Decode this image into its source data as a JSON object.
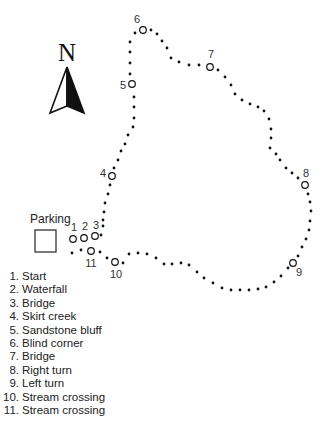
{
  "map": {
    "north_label": "N",
    "parking_label": "Parking",
    "markers": [
      {
        "id": "1",
        "x": 73,
        "y": 239,
        "lx": 74,
        "ly": 231
      },
      {
        "id": "2",
        "x": 84,
        "y": 238,
        "lx": 85,
        "ly": 230
      },
      {
        "id": "3",
        "x": 95,
        "y": 236,
        "lx": 96,
        "ly": 229
      },
      {
        "id": "4",
        "x": 112,
        "y": 176,
        "lx": 103,
        "ly": 177
      },
      {
        "id": "5",
        "x": 132,
        "y": 84,
        "lx": 123,
        "ly": 89
      },
      {
        "id": "6",
        "x": 143,
        "y": 30,
        "lx": 137,
        "ly": 23
      },
      {
        "id": "7",
        "x": 210,
        "y": 67,
        "lx": 211,
        "ly": 58
      },
      {
        "id": "8",
        "x": 305,
        "y": 185,
        "lx": 306,
        "ly": 177
      },
      {
        "id": "9",
        "x": 293,
        "y": 263,
        "lx": 299,
        "ly": 276
      },
      {
        "id": "10",
        "x": 115,
        "y": 262,
        "lx": 116,
        "ly": 278
      },
      {
        "id": "11",
        "x": 91,
        "y": 251,
        "lx": 91,
        "ly": 267
      }
    ],
    "trail_dots": [
      [
        103,
        226
      ],
      [
        101,
        235
      ],
      [
        103,
        220
      ],
      [
        104,
        212
      ],
      [
        105,
        203
      ],
      [
        108,
        194
      ],
      [
        110,
        185
      ],
      [
        114,
        168
      ],
      [
        118,
        160
      ],
      [
        121,
        151
      ],
      [
        125,
        144
      ],
      [
        128,
        135
      ],
      [
        133,
        127
      ],
      [
        134,
        118
      ],
      [
        134,
        107
      ],
      [
        134,
        97
      ],
      [
        130,
        74
      ],
      [
        130,
        63
      ],
      [
        130,
        52
      ],
      [
        130,
        42
      ],
      [
        135,
        33
      ],
      [
        151,
        30
      ],
      [
        157,
        34
      ],
      [
        162,
        41
      ],
      [
        167,
        48
      ],
      [
        171,
        58
      ],
      [
        179,
        62
      ],
      [
        189,
        65
      ],
      [
        199,
        65
      ],
      [
        218,
        70
      ],
      [
        225,
        77
      ],
      [
        231,
        85
      ],
      [
        235,
        94
      ],
      [
        242,
        100
      ],
      [
        250,
        104
      ],
      [
        258,
        107
      ],
      [
        264,
        111
      ],
      [
        269,
        119
      ],
      [
        271,
        129
      ],
      [
        271,
        138
      ],
      [
        270,
        148
      ],
      [
        276,
        154
      ],
      [
        280,
        160
      ],
      [
        286,
        168
      ],
      [
        292,
        173
      ],
      [
        298,
        178
      ],
      [
        308,
        194
      ],
      [
        310,
        202
      ],
      [
        311,
        211
      ],
      [
        310,
        221
      ],
      [
        309,
        230
      ],
      [
        306,
        239
      ],
      [
        302,
        247
      ],
      [
        298,
        256
      ],
      [
        288,
        268
      ],
      [
        281,
        276
      ],
      [
        274,
        282
      ],
      [
        266,
        287
      ],
      [
        258,
        289
      ],
      [
        249,
        290
      ],
      [
        240,
        290
      ],
      [
        231,
        290
      ],
      [
        222,
        288
      ],
      [
        213,
        283
      ],
      [
        204,
        278
      ],
      [
        197,
        272
      ],
      [
        189,
        265
      ],
      [
        181,
        263
      ],
      [
        172,
        264
      ],
      [
        164,
        264
      ],
      [
        156,
        258
      ],
      [
        147,
        254
      ],
      [
        138,
        253
      ],
      [
        129,
        254
      ],
      [
        123,
        263
      ],
      [
        107,
        258
      ],
      [
        100,
        252
      ],
      [
        81,
        250
      ],
      [
        72,
        253
      ]
    ]
  },
  "legend": {
    "items": [
      {
        "num": "1.",
        "label": "Start"
      },
      {
        "num": "2.",
        "label": "Waterfall"
      },
      {
        "num": "3.",
        "label": "Bridge"
      },
      {
        "num": "4.",
        "label": "Skirt creek"
      },
      {
        "num": "5.",
        "label": "Sandstone bluff"
      },
      {
        "num": "6.",
        "label": "Blind corner"
      },
      {
        "num": "7.",
        "label": "Bridge"
      },
      {
        "num": "8.",
        "label": "Right turn"
      },
      {
        "num": "9.",
        "label": "Left turn"
      },
      {
        "num": "10.",
        "label": "Stream crossing"
      },
      {
        "num": "11.",
        "label": "Stream crossing"
      }
    ]
  }
}
